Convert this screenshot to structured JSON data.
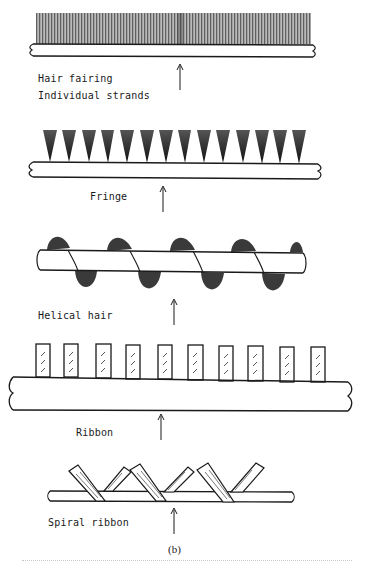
{
  "figure": {
    "panel_label": "(b)",
    "colors": {
      "ink": "#1a1a1a",
      "hatch": "#444444",
      "background": "#ffffff"
    },
    "sections": [
      {
        "id": "hair-fairing",
        "labels": [
          "Hair fairing",
          "Individual strands"
        ],
        "description": "Dense continuous brush of hair strands along top of cable"
      },
      {
        "id": "fringe",
        "labels": [
          "Fringe"
        ],
        "tuft_count": 14,
        "description": "Discrete triangular tufts along top of cable"
      },
      {
        "id": "helical-hair",
        "labels": [
          "Helical hair"
        ],
        "description": "Hair wrapped helically around cable, tufts alternating above and below"
      },
      {
        "id": "ribbon",
        "labels": [
          "Ribbon"
        ],
        "ribbon_count": 10,
        "description": "Rectangular hatched ribbons standing on cable"
      },
      {
        "id": "spiral-ribbon",
        "labels": [
          "Spiral ribbon"
        ],
        "description": "Angled ribbon strips wrapped spirally around cable"
      }
    ]
  }
}
